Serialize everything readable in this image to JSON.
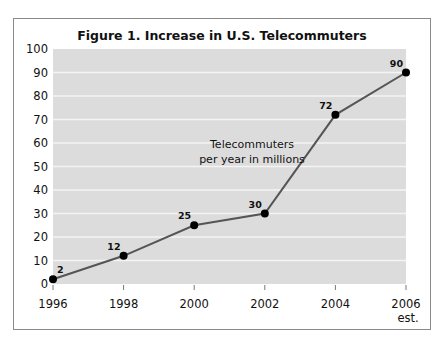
{
  "chart_data": {
    "type": "line",
    "title": "Figure 1. Increase in U.S. Telecommuters",
    "xlabel": "",
    "ylabel": "",
    "x": [
      1996,
      1998,
      2000,
      2002,
      2004,
      2006
    ],
    "x_tick_labels": [
      "1996",
      "1998",
      "2000",
      "2002",
      "2004",
      "2006"
    ],
    "x_tick_sublabels": [
      "",
      "",
      "",
      "",
      "",
      "est."
    ],
    "series": [
      {
        "name": "Telecommuters per year in millions",
        "values": [
          2,
          12,
          25,
          30,
          72,
          90
        ]
      }
    ],
    "data_labels": [
      "2",
      "12",
      "25",
      "30",
      "72",
      "90"
    ],
    "ylim": [
      0,
      100
    ],
    "yticks": [
      0,
      10,
      20,
      30,
      40,
      50,
      60,
      70,
      80,
      90,
      100
    ],
    "grid": true,
    "annotation_lines": [
      "Telecommuters",
      "per year in millions"
    ],
    "colors": {
      "plot_bg": "#dcdcdc",
      "grid": "#f4f4f4",
      "line": "#555555",
      "marker": "#000000"
    }
  }
}
